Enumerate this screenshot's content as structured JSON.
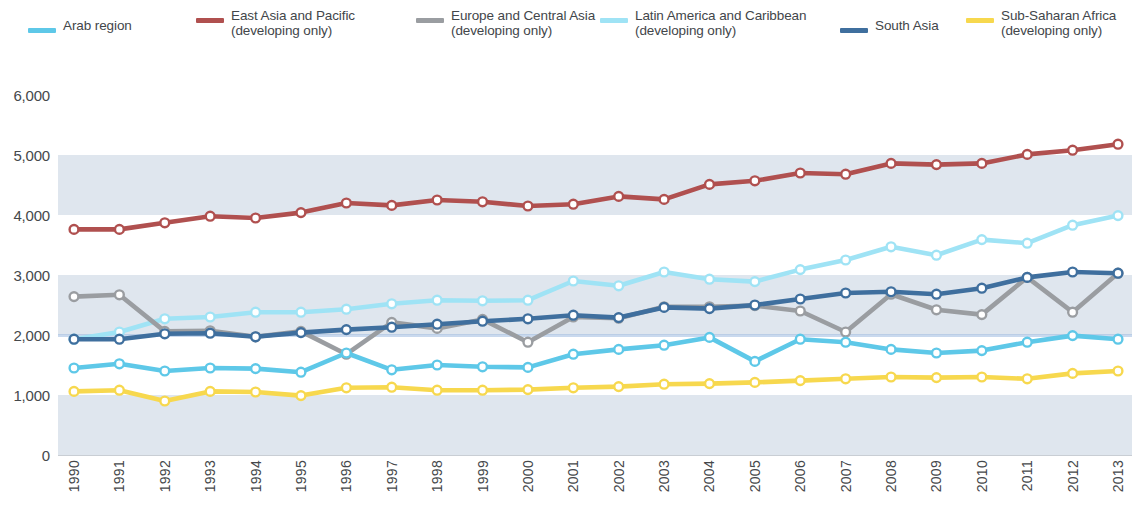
{
  "legend": {
    "items": [
      {
        "label": "Arab region",
        "color": "#5ec8e8",
        "x": 28,
        "y": 18
      },
      {
        "label": "East Asia and Pacific\n(developing only)",
        "color": "#b0504f",
        "x": 196,
        "y": 8
      },
      {
        "label": "Europe and Central Asia\n(developing only)",
        "color": "#9a9da1",
        "x": 416,
        "y": 8
      },
      {
        "label": "Latin America and Caribbean\n(developing only)",
        "color": "#9fe3f5",
        "x": 600,
        "y": 8
      },
      {
        "label": "South Asia",
        "color": "#3f6f9e",
        "x": 840,
        "y": 18
      },
      {
        "label": "Sub-Saharan Africa\n(developing only)",
        "color": "#f7d84e",
        "x": 966,
        "y": 8
      }
    ]
  },
  "axes": {
    "y_ticks": [
      "6,000",
      "5,000",
      "4,000",
      "3,000",
      "2,000",
      "1,000",
      "0"
    ],
    "y_values": [
      6000,
      5000,
      4000,
      3000,
      2000,
      1000,
      0
    ]
  },
  "style": {
    "band_color": "#ccd7e4",
    "gridline_color": "#9db9e0",
    "marker_fill": "#ffffff",
    "background": "#ffffff"
  },
  "chart_data": {
    "type": "line",
    "title": "",
    "subtitle": "",
    "xlabel": "",
    "ylabel": "",
    "ylim": [
      0,
      6000
    ],
    "ytick_step": 1000,
    "grid": "horizontal-bands",
    "legend_position": "top",
    "markers": "open-circle",
    "x": [
      1990,
      1991,
      1992,
      1993,
      1994,
      1995,
      1996,
      1997,
      1998,
      1999,
      2000,
      2001,
      2002,
      2003,
      2004,
      2005,
      2006,
      2007,
      2008,
      2009,
      2010,
      2011,
      2012,
      2013
    ],
    "categories": [
      "1990",
      "1991",
      "1992",
      "1993",
      "1994",
      "1995",
      "1996",
      "1997",
      "1998",
      "1999",
      "2000",
      "2001",
      "2002",
      "2003",
      "2004",
      "2005",
      "2006",
      "2007",
      "2008",
      "2009",
      "2010",
      "2011",
      "2012",
      "2013"
    ],
    "series": [
      {
        "name": "Arab region",
        "color": "#5ec8e8",
        "values": [
          1450,
          1520,
          1400,
          1450,
          1440,
          1380,
          1700,
          1420,
          1500,
          1470,
          1460,
          1680,
          1760,
          1830,
          1960,
          1560,
          1930,
          1880,
          1760,
          1700,
          1740,
          1880,
          1990,
          1930
        ]
      },
      {
        "name": "East Asia and Pacific (developing only)",
        "color": "#b0504f",
        "values": [
          3760,
          3760,
          3870,
          3980,
          3950,
          4040,
          4200,
          4160,
          4250,
          4220,
          4150,
          4180,
          4310,
          4260,
          4510,
          4570,
          4700,
          4680,
          4860,
          4840,
          4860,
          5010,
          5080,
          5180
        ]
      },
      {
        "name": "Europe and Central Asia (developing only)",
        "color": "#9a9da1",
        "values": [
          2640,
          2670,
          2060,
          2070,
          1970,
          2060,
          1680,
          2210,
          2110,
          2260,
          1880,
          2300,
          2280,
          2470,
          2470,
          2490,
          2400,
          2050,
          2680,
          2420,
          2340,
          2960,
          2380,
          3030
        ]
      },
      {
        "name": "Latin America and Caribbean (developing only)",
        "color": "#9fe3f5",
        "values": [
          1930,
          2050,
          2270,
          2300,
          2380,
          2380,
          2430,
          2520,
          2580,
          2570,
          2580,
          2900,
          2820,
          3050,
          2930,
          2890,
          3090,
          3250,
          3470,
          3330,
          3590,
          3530,
          3830,
          3990
        ]
      },
      {
        "name": "South Asia",
        "color": "#3f6f9e",
        "values": [
          1930,
          1930,
          2020,
          2030,
          1970,
          2040,
          2090,
          2130,
          2180,
          2230,
          2270,
          2330,
          2290,
          2460,
          2440,
          2500,
          2600,
          2700,
          2720,
          2680,
          2780,
          2960,
          3050,
          3030
        ]
      },
      {
        "name": "Sub-Saharan Africa (developing only)",
        "color": "#f7d84e",
        "values": [
          1060,
          1080,
          900,
          1060,
          1050,
          990,
          1120,
          1130,
          1080,
          1080,
          1090,
          1120,
          1140,
          1180,
          1190,
          1210,
          1240,
          1270,
          1300,
          1290,
          1300,
          1270,
          1360,
          1400
        ]
      }
    ]
  }
}
